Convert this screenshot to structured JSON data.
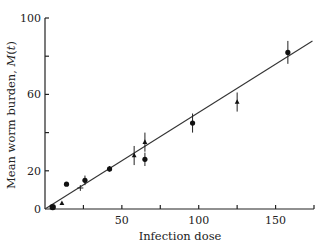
{
  "chart_data": {
    "type": "scatter",
    "title": "",
    "xlabel": "Infection dose",
    "ylabel": "Mean worm burden, M(t)",
    "xlim": [
      0,
      175
    ],
    "ylim": [
      0,
      100
    ],
    "x_ticks": [
      0,
      25,
      50,
      75,
      100,
      125,
      150,
      175
    ],
    "x_tick_labels": [
      "",
      "",
      "50",
      "",
      "100",
      "",
      "150",
      ""
    ],
    "y_ticks": [
      0,
      20,
      40,
      60,
      80,
      100
    ],
    "y_tick_labels": [
      "0",
      "20",
      "",
      "60",
      "",
      "100"
    ],
    "origin_label": "0",
    "grid": false,
    "legend": null,
    "fit_line": {
      "x": [
        0,
        174
      ],
      "y": [
        0,
        88
      ]
    },
    "series": [
      {
        "name": "circles",
        "marker": "circle",
        "points": [
          {
            "x": 5,
            "y": 1,
            "err": 0
          },
          {
            "x": 14,
            "y": 13,
            "err": 0
          },
          {
            "x": 26,
            "y": 15,
            "err": 2.5
          },
          {
            "x": 42,
            "y": 21,
            "err": 1.5
          },
          {
            "x": 65,
            "y": 26,
            "err": 3.5
          },
          {
            "x": 96,
            "y": 45,
            "err": 5
          },
          {
            "x": 158,
            "y": 82,
            "err": 6
          }
        ]
      },
      {
        "name": "triangles",
        "marker": "triangle",
        "points": [
          {
            "x": 11,
            "y": 3,
            "err": 0
          },
          {
            "x": 58,
            "y": 28,
            "err": 5
          },
          {
            "x": 65,
            "y": 35,
            "err": 5
          },
          {
            "x": 125,
            "y": 56,
            "err": 5
          }
        ]
      },
      {
        "name": "crosses",
        "marker": "cross",
        "points": [
          {
            "x": 23,
            "y": 11,
            "err": 1.5
          }
        ]
      }
    ]
  }
}
